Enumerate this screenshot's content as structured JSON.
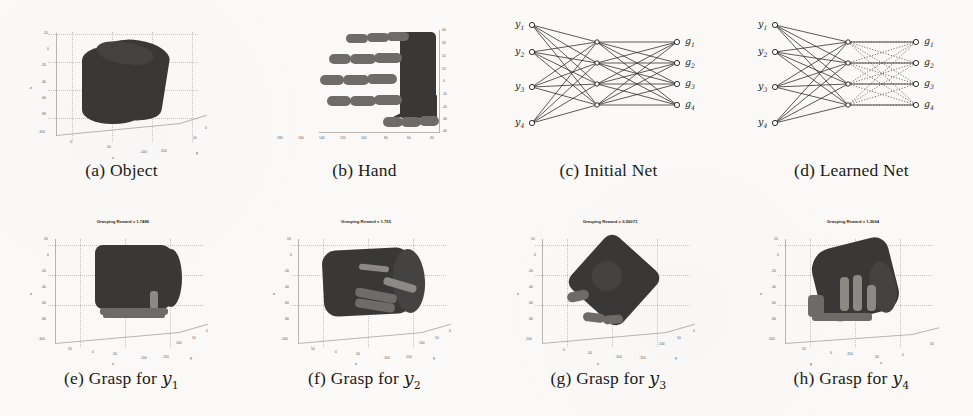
{
  "figure": {
    "background": "#fbfaf8",
    "ink": "#1a1a1a"
  },
  "panels": [
    {
      "id": "a",
      "caption_prefix": "(a)",
      "caption_text": "Object",
      "kind": "render-3d",
      "title": "",
      "yticks": [
        "20",
        "0",
        "-20",
        "-40",
        "-60",
        "-80",
        "-100"
      ],
      "xticks": [
        "0",
        "-50",
        "-100",
        "-150"
      ],
      "zticks": [
        "50",
        "0"
      ],
      "xlabel": "x",
      "ylabel": "z",
      "zlabel": "y"
    },
    {
      "id": "b",
      "caption_prefix": "(b)",
      "caption_text": "Hand",
      "kind": "render-2d",
      "title": "",
      "yticks": [
        "40",
        "30",
        "20",
        "10",
        "0",
        "-10",
        "-20",
        "-30",
        "-40"
      ],
      "xticks": [
        "180",
        "160",
        "140",
        "120",
        "100",
        "80",
        "60",
        "40"
      ],
      "xlabel": "",
      "ylabel": "",
      "zlabel": ""
    },
    {
      "id": "c",
      "caption_prefix": "(c)",
      "caption_text": "Initial Net",
      "kind": "network",
      "network": {
        "input_labels": [
          "y1",
          "y2",
          "y3",
          "y4"
        ],
        "output_labels": [
          "g1",
          "g2",
          "g3",
          "g4"
        ],
        "layers": [
          4,
          4,
          4,
          4
        ],
        "left_edge_style": "solid",
        "right_edge_style": "solid",
        "node_shape": "circle"
      }
    },
    {
      "id": "d",
      "caption_prefix": "(d)",
      "caption_text": "Learned Net",
      "kind": "network",
      "network": {
        "input_labels": [
          "y1",
          "y2",
          "y3",
          "y4"
        ],
        "output_labels": [
          "g1",
          "g2",
          "g3",
          "g4"
        ],
        "layers": [
          4,
          4,
          4,
          4
        ],
        "left_edge_style": "solid",
        "right_edge_style": "dotted",
        "node_shape": "circle"
      }
    },
    {
      "id": "e",
      "caption_prefix": "(e)",
      "caption_text": "Grasp for",
      "caption_var": "y",
      "caption_sub": "1",
      "kind": "render-3d",
      "title": "Grasping Reward = 1.7486",
      "yticks": [
        "20",
        "0",
        "-20",
        "-40",
        "-60",
        "-80",
        "-100"
      ],
      "xticks": [
        "50",
        "0",
        "-50",
        "-100",
        "-150"
      ],
      "zticks": [
        "100",
        "50",
        "0"
      ],
      "xlabel": "x",
      "ylabel": "z",
      "zlabel": "y"
    },
    {
      "id": "f",
      "caption_prefix": "(f)",
      "caption_text": "Grasp for",
      "caption_var": "y",
      "caption_sub": "2",
      "kind": "render-3d",
      "title": "Grasping Reward = 1.755",
      "yticks": [
        "20",
        "0",
        "-20",
        "-40",
        "-60",
        "-80",
        "-100"
      ],
      "xticks": [
        "50",
        "0",
        "-50",
        "-100",
        "-150"
      ],
      "zticks": [
        "100",
        "50",
        "0"
      ],
      "xlabel": "x",
      "ylabel": "z",
      "zlabel": "y"
    },
    {
      "id": "g",
      "caption_prefix": "(g)",
      "caption_text": "Grasp for",
      "caption_var": "y",
      "caption_sub": "3",
      "kind": "render-3d",
      "title": "Grasping Reward = 0.56073",
      "yticks": [
        "20",
        "0",
        "-20",
        "-40",
        "-60",
        "-80",
        "-100"
      ],
      "xticks": [
        "0",
        "-50",
        "-100",
        "-150"
      ],
      "zticks": [
        "100",
        "50",
        "0"
      ],
      "xlabel": "x",
      "ylabel": "z",
      "zlabel": "y"
    },
    {
      "id": "h",
      "caption_prefix": "(h)",
      "caption_text": "Grasp for",
      "caption_var": "y",
      "caption_sub": "4",
      "kind": "render-3d",
      "title": "Grasping Reward = 1.3664",
      "yticks": [
        "20",
        "0",
        "-20",
        "-40",
        "-60",
        "-80",
        "-100"
      ],
      "xticks": [
        "50",
        "0",
        "-50",
        "-100",
        "-150"
      ],
      "zticks": [
        "50",
        "0"
      ],
      "xlabel": "x",
      "ylabel": "z",
      "zlabel": "y"
    }
  ]
}
